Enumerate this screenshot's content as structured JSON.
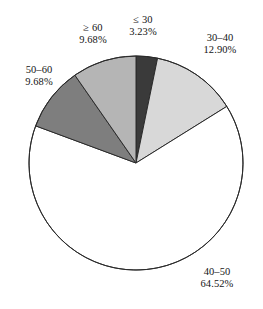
{
  "chart_data": {
    "type": "pie",
    "title": "",
    "subtitle": "",
    "xlabel": "",
    "ylabel": "",
    "legend_position": "none",
    "grid": false,
    "label_format": "category above percentage",
    "start_angle_deg": -90,
    "direction": "clockwise",
    "categories": [
      "≤ 30",
      "30–40",
      "40–50",
      "50–60",
      "≥ 60"
    ],
    "values": [
      3.23,
      12.9,
      64.52,
      9.68,
      9.68
    ],
    "value_unit": "%",
    "slices": [
      {
        "label": "≤ 30",
        "value_text": "3.23%",
        "value": 3.23,
        "color": "#3a3a3a",
        "sweep_deg": 11.63
      },
      {
        "label": "30–40",
        "value_text": "12.90%",
        "value": 12.9,
        "color": "#d8d8d8",
        "sweep_deg": 46.44
      },
      {
        "label": "40–50",
        "value_text": "64.52%",
        "value": 64.52,
        "color": "#ffffff",
        "sweep_deg": 232.27
      },
      {
        "label": "50–60",
        "value_text": "9.68%",
        "value": 9.68,
        "color": "#7e7e7e",
        "sweep_deg": 34.85
      },
      {
        "label": "≥ 60",
        "value_text": "9.68%",
        "value": 9.68,
        "color": "#b5b5b5",
        "sweep_deg": 34.85
      }
    ],
    "outline_color": "#2b2b2b",
    "background_color": "#ffffff"
  },
  "labels": {
    "le30": {
      "name": "≤ 30",
      "value": "3.23%"
    },
    "r30_40": {
      "name": "30–40",
      "value": "12.90%"
    },
    "r40_50": {
      "name": "40–50",
      "value": "64.52%"
    },
    "r50_60": {
      "name": "50–60",
      "value": "9.68%"
    },
    "ge60": {
      "name": "≥ 60",
      "value": "9.68%"
    }
  }
}
